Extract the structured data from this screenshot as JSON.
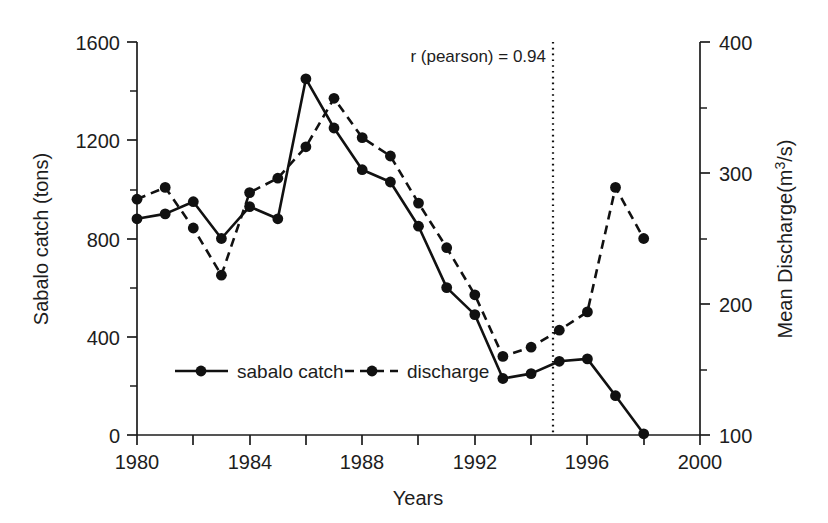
{
  "chart_data": {
    "type": "line",
    "title": "",
    "xlabel": "Years",
    "ylabel": "Sabalo catch (tons)",
    "y2label": "Mean Discharge(m3/s)",
    "y2label_parts": {
      "pre": "Mean Discharge(m",
      "sup": "3",
      "post": "/s)"
    },
    "grid": false,
    "legend_position": "inside-lower-left",
    "xlim": [
      1980,
      2000
    ],
    "ylim": [
      0,
      1600
    ],
    "y2lim": [
      100,
      400
    ],
    "xticks": [
      1980,
      1982,
      1984,
      1986,
      1988,
      1990,
      1992,
      1994,
      1996,
      1998,
      2000
    ],
    "xticklabels": [
      "1980",
      "",
      "1984",
      "",
      "1988",
      "",
      "1992",
      "",
      "1996",
      "",
      "2000"
    ],
    "yticks": [
      0,
      200,
      400,
      600,
      800,
      1000,
      1200,
      1400,
      1600
    ],
    "yticklabels": [
      "0",
      "",
      "400",
      "",
      "800",
      "",
      "1200",
      "",
      "1600"
    ],
    "y2ticks": [
      100,
      150,
      200,
      250,
      300,
      350,
      400
    ],
    "y2ticklabels": [
      "100",
      "",
      "200",
      "",
      "300",
      "",
      "400"
    ],
    "x": [
      1980,
      1981,
      1982,
      1983,
      1984,
      1985,
      1986,
      1987,
      1988,
      1989,
      1990,
      1991,
      1992,
      1993,
      1994,
      1995,
      1996,
      1997,
      1998
    ],
    "series": [
      {
        "name": "sabalo catch",
        "axis": "left",
        "style": "solid",
        "marker": "circle",
        "color": "#111111",
        "values": [
          880,
          900,
          950,
          800,
          930,
          880,
          1450,
          1250,
          1080,
          1030,
          850,
          600,
          490,
          230,
          250,
          300,
          310,
          160,
          5
        ]
      },
      {
        "name": "discharge",
        "axis": "right",
        "style": "dashed",
        "marker": "circle",
        "color": "#111111",
        "values": [
          280,
          289,
          258,
          222,
          285,
          296,
          320,
          357,
          327,
          313,
          277,
          243,
          207,
          160,
          167,
          180,
          194,
          289,
          250
        ]
      }
    ],
    "annotations": [
      {
        "name": "pearson-correlation",
        "text": "r (pearson) = 0.94",
        "x": 1994,
        "y": 1540
      },
      {
        "name": "vertical-reference-line",
        "type": "vline",
        "x": 1994,
        "style": "dotted"
      }
    ]
  },
  "legend": {
    "items": [
      {
        "label": "sabalo catch",
        "style": "solid"
      },
      {
        "label": "discharge",
        "style": "dashed"
      }
    ]
  }
}
